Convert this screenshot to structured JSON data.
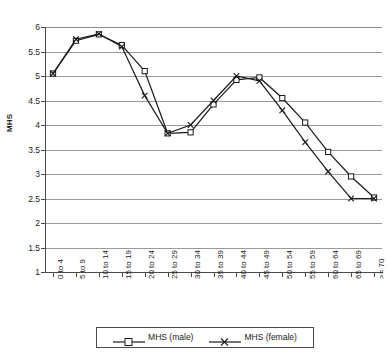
{
  "chart_data": {
    "type": "line",
    "title": "",
    "xlabel": "",
    "ylabel": "MHS",
    "ylim": [
      1,
      6
    ],
    "ytick_step": 0.5,
    "grid": true,
    "legend_position": "bottom",
    "categories": [
      "0 to 4",
      "5 to 9",
      "10 to 14",
      "15 to 19",
      "20 to 24",
      "25 to 29",
      "30 to 34",
      "35 to 39",
      "40 to 44",
      "45 to 49",
      "50 to 54",
      "55 to 59",
      "60 to 64",
      "65 to 69",
      ">= 70"
    ],
    "yticks": [
      "1",
      "1.5",
      "2",
      "2.5",
      "3",
      "3.5",
      "4",
      "4.5",
      "5",
      "5.5",
      "6"
    ],
    "series": [
      {
        "name": "MHS (male)",
        "marker": "square",
        "color": "#1a1a1a",
        "values": [
          5.05,
          5.72,
          5.85,
          5.63,
          5.1,
          3.83,
          3.85,
          4.42,
          4.92,
          4.97,
          4.55,
          4.05,
          3.45,
          2.95,
          2.52
        ]
      },
      {
        "name": "MHS (female)",
        "marker": "cross",
        "color": "#1a1a1a",
        "values": [
          5.05,
          5.75,
          5.86,
          5.6,
          4.6,
          3.83,
          4.0,
          4.5,
          5.0,
          4.9,
          4.3,
          3.65,
          3.05,
          2.5,
          2.5
        ]
      }
    ]
  },
  "legend": {
    "items": [
      {
        "label": "MHS (male)"
      },
      {
        "label": "MHS (female)"
      }
    ]
  },
  "axes": {
    "y_title": "MHS"
  }
}
